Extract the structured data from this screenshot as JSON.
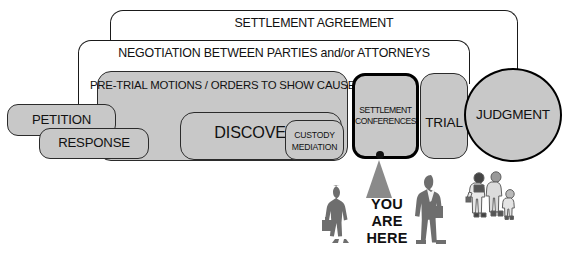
{
  "diagram": {
    "colors": {
      "stage_fill": "#c8c8c8",
      "arc_fill": "#ffffff",
      "border": "#1a1a1a",
      "current_border": "#000000",
      "figure_gray": "#6e6e6e",
      "pointer_gray": "#8a8a8a"
    },
    "arcs": [
      {
        "id": "settlement-agreement",
        "label": "SETTLEMENT AGREEMENT"
      },
      {
        "id": "negotiation",
        "label": "NEGOTIATION BETWEEN PARTIES and/or ATTORNEYS"
      }
    ],
    "stages": [
      {
        "id": "pretrial",
        "label": "PRE-TRIAL MOTIONS / ORDERS TO SHOW CAUSE",
        "current": false
      },
      {
        "id": "petition",
        "label": "PETITION",
        "current": false
      },
      {
        "id": "response",
        "label": "RESPONSE",
        "current": false
      },
      {
        "id": "discovery",
        "label": "DISCOVERY",
        "current": false
      },
      {
        "id": "custody",
        "label_line1": "CUSTODY",
        "label_line2": "MEDIATION",
        "current": false
      },
      {
        "id": "settlement-conferences",
        "label_line1": "SETTLEMENT",
        "label_line2": "CONFERENCES",
        "current": true
      },
      {
        "id": "trial",
        "label": "TRIAL",
        "current": false
      },
      {
        "id": "judgment",
        "label": "JUDGMENT",
        "current": false
      }
    ],
    "marker": {
      "line1": "YOU",
      "line2": "ARE",
      "line3": "HERE",
      "points_to": "SETTLEMENT CONFERENCES"
    },
    "figures": [
      {
        "id": "woman-figure",
        "description": "woman-with-briefcase-silhouette"
      },
      {
        "id": "man-figure",
        "description": "man-in-suit-silhouette"
      },
      {
        "id": "family-figure",
        "description": "family-group-line-art"
      }
    ]
  }
}
